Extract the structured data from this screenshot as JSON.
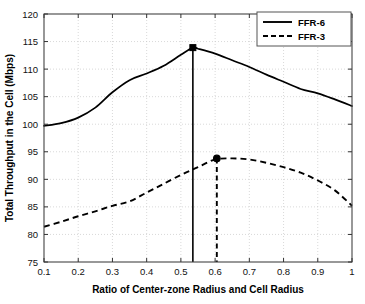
{
  "chart_data": {
    "type": "line",
    "title": "",
    "xlabel": "Ratio of Center-zone Radius and Cell Radius",
    "ylabel": "Total Throughput in the Cell (Mbps)",
    "xlim": [
      0.1,
      1.0
    ],
    "ylim": [
      75,
      120
    ],
    "xticks": [
      0.1,
      0.2,
      0.3,
      0.4,
      0.5,
      0.6,
      0.7,
      0.8,
      0.9,
      1
    ],
    "xtick_labels": [
      "0.1",
      "0.2",
      "0.3",
      "0.4",
      "0.5",
      "0.6",
      "0.7",
      "0.8",
      "0.9",
      "1"
    ],
    "yticks": [
      75,
      80,
      85,
      90,
      95,
      100,
      105,
      110,
      115,
      120
    ],
    "ytick_labels": [
      "75",
      "80",
      "85",
      "90",
      "95",
      "100",
      "105",
      "110",
      "115",
      "120"
    ],
    "grid": true,
    "grid_style": "dotted",
    "grid_color": "#c8c8c8",
    "legend_position": "top-right",
    "x": [
      0.1,
      0.15,
      0.2,
      0.25,
      0.3,
      0.35,
      0.4,
      0.45,
      0.5,
      0.535,
      0.55,
      0.6,
      0.65,
      0.7,
      0.75,
      0.8,
      0.85,
      0.9,
      0.95,
      1.0
    ],
    "series": [
      {
        "name": "FFR-6",
        "style": "solid",
        "color": "#000000",
        "values": [
          99.7,
          100.2,
          101.2,
          103.0,
          105.8,
          108.0,
          109.2,
          110.6,
          112.6,
          113.9,
          113.7,
          112.8,
          111.6,
          110.4,
          109.0,
          107.7,
          106.4,
          105.6,
          104.5,
          103.3
        ],
        "peak": {
          "x": 0.535,
          "y": 113.9,
          "marker": "square"
        }
      },
      {
        "name": "FFR-3",
        "style": "dashed",
        "color": "#000000",
        "values": [
          81.4,
          82.3,
          83.3,
          84.2,
          85.2,
          86.0,
          87.6,
          89.2,
          90.8,
          91.8,
          92.2,
          93.6,
          93.8,
          93.6,
          93.0,
          92.2,
          91.2,
          89.8,
          88.0,
          85.2
        ],
        "peak": {
          "x": 0.605,
          "y": 93.8,
          "marker": "circle"
        }
      }
    ],
    "annotations": [
      {
        "type": "vline",
        "x": 0.535,
        "y_from": 75,
        "y_to": 113.9,
        "style": "solid",
        "series": "FFR-6"
      },
      {
        "type": "vline",
        "x": 0.605,
        "y_from": 75,
        "y_to": 93.8,
        "style": "dashed",
        "series": "FFR-3"
      }
    ]
  },
  "legend": {
    "items": [
      {
        "label": "FFR-6",
        "style": "solid"
      },
      {
        "label": "FFR-3",
        "style": "dashed"
      }
    ]
  }
}
